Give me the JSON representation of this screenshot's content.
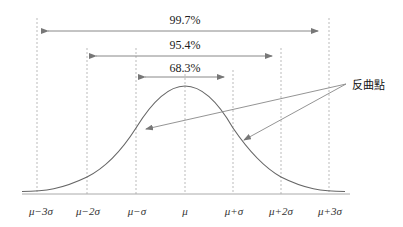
{
  "diagram": {
    "type": "normal-distribution",
    "intervals": [
      {
        "label": "99.7%",
        "from": "μ-3σ",
        "to": "μ+3σ"
      },
      {
        "label": "95.4%",
        "from": "μ-2σ",
        "to": "μ+2σ"
      },
      {
        "label": "68.3%",
        "from": "μ-σ",
        "to": "μ+σ"
      }
    ],
    "x_ticks": [
      "μ−3σ",
      "μ−2σ",
      "μ−σ",
      "μ",
      "μ+σ",
      "μ+2σ",
      "μ+3σ"
    ],
    "annotation": "反曲點",
    "colors": {
      "curve": "#666666",
      "arrow": "#888888",
      "dashed": "#aaaaaa",
      "baseline": "#aaaaaa"
    }
  }
}
